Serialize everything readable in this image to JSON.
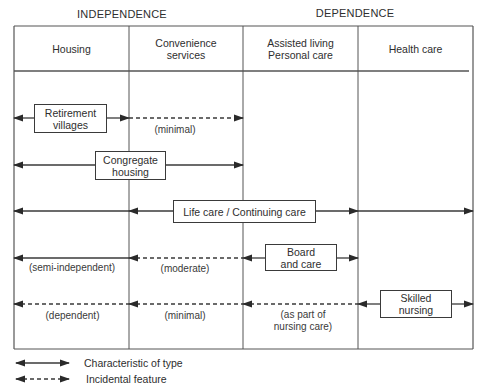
{
  "diagram": {
    "group_titles": [
      {
        "label": "INDEPENDENCE",
        "x": 57,
        "width": 130
      },
      {
        "label": "DEPENDENCE",
        "x": 290,
        "width": 130
      }
    ],
    "columns": [
      {
        "label": "Housing",
        "x": 14,
        "width": 115
      },
      {
        "label": "Convenience\nservices",
        "x": 129,
        "width": 114
      },
      {
        "label": "Assisted living\nPersonal care",
        "x": 243,
        "width": 115
      },
      {
        "label": "Health care",
        "x": 358,
        "width": 115
      }
    ],
    "rows": [
      {
        "name": "retirement-villages",
        "box_label": "Retirement\nvillages",
        "y": 118,
        "box": {
          "x": 34,
          "y": 104,
          "w": 73,
          "h": 29
        },
        "segments": [
          {
            "x1": 14,
            "x2": 34,
            "style": "solid",
            "arrow_start": true,
            "arrow_end": false
          },
          {
            "x1": 107,
            "x2": 129,
            "style": "solid",
            "arrow_start": false,
            "arrow_end": true
          },
          {
            "x1": 129,
            "x2": 243,
            "style": "dashed",
            "arrow_start": false,
            "arrow_end": true
          }
        ],
        "notes": [
          {
            "label": "(minimal)",
            "x": 140,
            "y": 124,
            "w": 70
          }
        ]
      },
      {
        "name": "congregate-housing",
        "box_label": "Congregate\nhousing",
        "y": 165,
        "box": {
          "x": 95,
          "y": 151,
          "w": 71,
          "h": 29
        },
        "segments": [
          {
            "x1": 14,
            "x2": 95,
            "style": "solid",
            "arrow_start": true,
            "arrow_end": false
          },
          {
            "x1": 166,
            "x2": 243,
            "style": "solid",
            "arrow_start": false,
            "arrow_end": true
          }
        ],
        "notes": []
      },
      {
        "name": "life-care",
        "box_label": "Life care / Continuing care",
        "y": 211,
        "box": {
          "x": 173,
          "y": 200,
          "w": 143,
          "h": 23
        },
        "segments": [
          {
            "x1": 14,
            "x2": 129,
            "style": "solid",
            "arrow_start": true,
            "arrow_end": false
          },
          {
            "x1": 129,
            "x2": 173,
            "style": "solid",
            "arrow_start": true,
            "arrow_end": false
          },
          {
            "x1": 316,
            "x2": 358,
            "style": "solid",
            "arrow_start": false,
            "arrow_end": true
          },
          {
            "x1": 358,
            "x2": 473,
            "style": "solid",
            "arrow_start": false,
            "arrow_end": true
          }
        ],
        "notes": []
      },
      {
        "name": "board-and-care",
        "box_label": "Board\nand care",
        "y": 258,
        "box": {
          "x": 265,
          "y": 244,
          "w": 72,
          "h": 27
        },
        "segments": [
          {
            "x1": 14,
            "x2": 129,
            "style": "solid",
            "arrow_start": true,
            "arrow_end": false
          },
          {
            "x1": 129,
            "x2": 243,
            "style": "dashed",
            "arrow_start": true,
            "arrow_end": false
          },
          {
            "x1": 243,
            "x2": 265,
            "style": "solid",
            "arrow_start": true,
            "arrow_end": false
          },
          {
            "x1": 337,
            "x2": 358,
            "style": "solid",
            "arrow_start": false,
            "arrow_end": true
          }
        ],
        "notes": [
          {
            "label": "(semi-independent)",
            "x": 18,
            "y": 262,
            "w": 108
          },
          {
            "label": "(moderate)",
            "x": 150,
            "y": 263,
            "w": 70
          }
        ]
      },
      {
        "name": "skilled-nursing",
        "box_label": "Skilled\nnursing",
        "y": 304,
        "box": {
          "x": 380,
          "y": 290,
          "w": 72,
          "h": 28
        },
        "segments": [
          {
            "x1": 14,
            "x2": 129,
            "style": "dashed",
            "arrow_start": true,
            "arrow_end": false
          },
          {
            "x1": 129,
            "x2": 243,
            "style": "dashed",
            "arrow_start": true,
            "arrow_end": false
          },
          {
            "x1": 243,
            "x2": 358,
            "style": "dashed",
            "arrow_start": true,
            "arrow_end": false
          },
          {
            "x1": 358,
            "x2": 380,
            "style": "solid",
            "arrow_start": true,
            "arrow_end": false
          },
          {
            "x1": 452,
            "x2": 473,
            "style": "solid",
            "arrow_start": false,
            "arrow_end": true
          }
        ],
        "notes": [
          {
            "label": "(dependent)",
            "x": 30,
            "y": 310,
            "w": 85
          },
          {
            "label": "(minimal)",
            "x": 150,
            "y": 310,
            "w": 70
          },
          {
            "label": "(as part of\nnursing care)",
            "x": 258,
            "y": 309,
            "w": 90
          }
        ]
      }
    ],
    "table": {
      "left": 14,
      "right": 473,
      "top": 26,
      "header_bottom": 71,
      "bottom": 349
    },
    "colors": {
      "line": "#3a3a3a",
      "grid": "#555555",
      "text": "#2e2e2e"
    }
  },
  "legend": {
    "items": [
      {
        "label": "Characteristic of type",
        "style": "solid",
        "y": 363
      },
      {
        "label": "Incidental feature",
        "style": "dashed",
        "y": 379
      }
    ]
  }
}
